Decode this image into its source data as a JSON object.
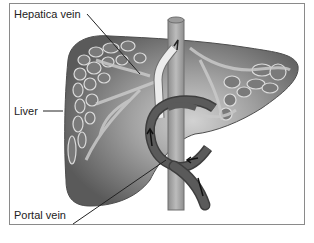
{
  "diagram": {
    "labels": {
      "hepatic_vein": "Hepatica vein",
      "liver": "Liver",
      "portal_vein": "Portal vein"
    },
    "colors": {
      "liver_dark": "#5e5e5e",
      "liver_mid": "#8c8c8c",
      "liver_light": "#c8c8c8",
      "vessel_outline": "#d8d8d8",
      "portal_vein": "#4a4a4a",
      "vena_cava": "#a9a9a9",
      "hepatic_vein": "#e6e6e6",
      "frame": "#8a8a8a"
    }
  }
}
